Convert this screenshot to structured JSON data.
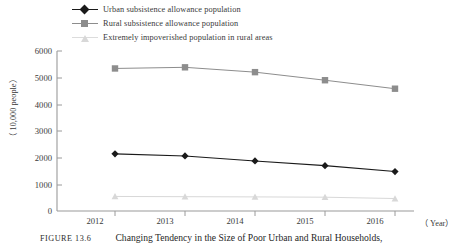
{
  "figure": {
    "caption_number": "FIGURE 13.6",
    "caption_text": "Changing Tendency in the Size of Poor Urban and Rural Households,"
  },
  "legend": {
    "items": [
      {
        "label": "Urban subsistence allowance population",
        "marker": "diamond-marker-icon",
        "color": "#1a1a1a"
      },
      {
        "label": "Rural subsistence allowance population",
        "marker": "square-marker-icon",
        "color": "#8d8d8d"
      },
      {
        "label": "Extremely impoverished population in rural areas",
        "marker": "triangle-marker-icon",
        "color": "#d8d8d8"
      }
    ]
  },
  "axes": {
    "y_axis_label": "（ 10,000 people）",
    "x_axis_label": "（ Year）",
    "y_ticks": [
      "6000",
      "5000",
      "4000",
      "3000",
      "2000",
      "1000",
      "0"
    ],
    "x_ticks": [
      "2012",
      "2013",
      "2014",
      "2015",
      "2016"
    ]
  },
  "chart_data": {
    "type": "line",
    "title": "Changing Tendency in the Size of Poor Urban and Rural Households,",
    "xlabel": "（ Year）",
    "ylabel": "（ 10,000 people）",
    "x": [
      "2012",
      "2013",
      "2014",
      "2015",
      "2016"
    ],
    "ylim": [
      0,
      6000
    ],
    "yticks": [
      0,
      1000,
      2000,
      3000,
      4000,
      5000,
      6000
    ],
    "grid": false,
    "legend_position": "top-left",
    "series": [
      {
        "name": "Urban subsistence allowance population",
        "marker": "diamond",
        "color": "#1a1a1a",
        "values": [
          2143,
          2064,
          1877,
          1701,
          1480
        ]
      },
      {
        "name": "Rural subsistence allowance population",
        "marker": "square",
        "color": "#8d8d8d",
        "values": [
          5345,
          5388,
          5207,
          4904,
          4586
        ]
      },
      {
        "name": "Extremely impoverished population in rural areas",
        "marker": "triangle",
        "color": "#d8d8d8",
        "values": [
          545,
          537,
          529,
          517,
          467
        ]
      }
    ]
  }
}
